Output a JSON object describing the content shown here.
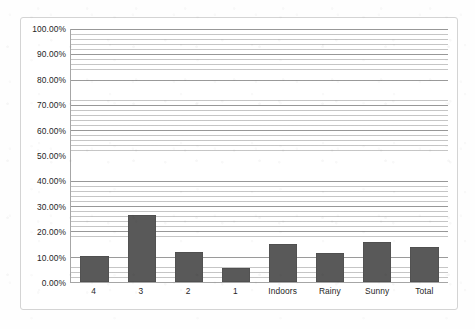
{
  "chart_data": {
    "type": "bar",
    "title": "",
    "subtitle": "",
    "xlabel": "",
    "ylabel": "",
    "categories": [
      "4",
      "3",
      "2",
      "1",
      "Indoors",
      "Rainy",
      "Sunny",
      "Total"
    ],
    "values": [
      10.3,
      26.5,
      11.8,
      5.5,
      15.0,
      11.5,
      15.8,
      14.0
    ],
    "series": [
      {
        "name": "Series 1",
        "values": [
          10.3,
          26.5,
          11.8,
          5.5,
          15.0,
          11.5,
          15.8,
          14.0
        ]
      }
    ],
    "ylim": [
      0,
      100
    ],
    "ytick_labels": [
      "100.00%",
      "90.00%",
      "80.00%",
      "70.00%",
      "60.00%",
      "50.00%",
      "40.00%",
      "30.00%",
      "20.00%",
      "10.00%",
      "0.00%"
    ],
    "ytick_values": [
      100,
      90,
      80,
      70,
      60,
      50,
      40,
      30,
      20,
      10,
      0
    ],
    "grid": true,
    "grid_orientation": "horizontal",
    "minor_grid_step": 2,
    "major_grid_step": 10,
    "legend": false,
    "legend_position": "none",
    "bar_color": "#595959",
    "plot_background": "#ffffff",
    "axis_color": "#a6a6a6",
    "gridline_color": "#969696",
    "frame_border_color": "#d4d4d4",
    "text_color": "#262626"
  }
}
